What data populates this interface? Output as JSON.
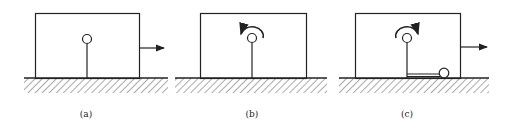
{
  "figure": {
    "panels": [
      {
        "id": "a",
        "label": "(a)",
        "block_motion_arrow": "right",
        "rotation_arrow": "none",
        "rod": "vertical rod with ball at top"
      },
      {
        "id": "b",
        "label": "(b)",
        "block_motion_arrow": "none",
        "rotation_arrow": "counterclockwise",
        "rod": "vertical rod with ball at top"
      },
      {
        "id": "c",
        "label": "(c)",
        "block_motion_arrow": "right",
        "rotation_arrow": "clockwise",
        "rod": "vertical rod with ball at top, plus horizontal rod with ball resting on ground"
      }
    ]
  },
  "colors": {
    "stroke": "#222222",
    "background": "#ffffff"
  }
}
